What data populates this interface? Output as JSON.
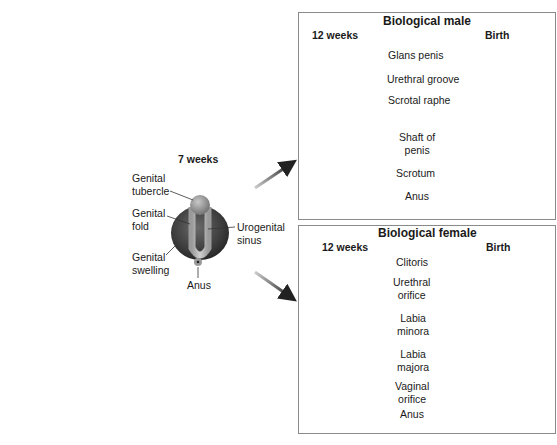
{
  "seven_weeks": {
    "stage": "7 weeks",
    "labels": {
      "genital_tubercle": [
        "Genital",
        "tubercle"
      ],
      "genital_fold": [
        "Genital",
        "fold"
      ],
      "genital_swelling": [
        "Genital",
        "swelling"
      ],
      "urogenital_sinus": [
        "Urogenital",
        "sinus"
      ],
      "anus": "Anus"
    }
  },
  "male": {
    "title": "Biological male",
    "stage_left": "12 weeks",
    "stage_right": "Birth",
    "labels": {
      "glans_penis": "Glans penis",
      "urethral_groove": "Urethral groove",
      "scrotal_raphe": "Scrotal raphe",
      "shaft_of_penis": [
        "Shaft of",
        "penis"
      ],
      "scrotum": "Scrotum",
      "anus": "Anus"
    }
  },
  "female": {
    "title": "Biological female",
    "stage_left": "12 weeks",
    "stage_right": "Birth",
    "labels": {
      "clitoris": "Clitoris",
      "urethral_orifice": [
        "Urethral",
        "orifice"
      ],
      "labia_minora": [
        "Labia",
        "minora"
      ],
      "labia_majora": [
        "Labia",
        "majora"
      ],
      "vaginal_orifice": [
        "Vaginal",
        "orifice"
      ],
      "anus": "Anus"
    }
  },
  "colors": {
    "dark_tissue": "#3a3a3a",
    "mid_tissue": "#8c8c8c",
    "light_tissue": "#bdbdbd",
    "panel_border": "#8a8a8a",
    "leader_line": "#333333"
  }
}
